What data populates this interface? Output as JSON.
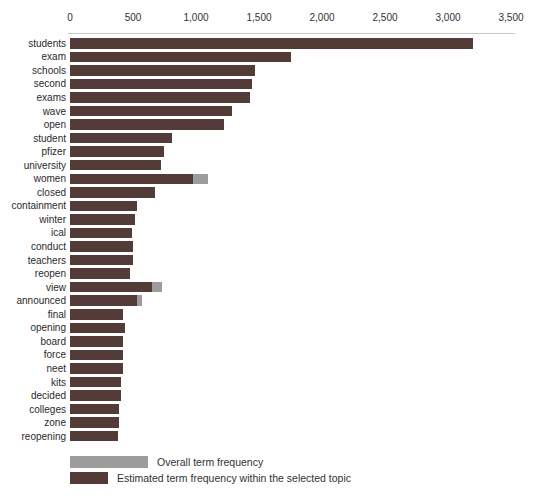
{
  "chart_data": {
    "type": "bar",
    "orientation": "horizontal",
    "title": "",
    "xlabel": "",
    "ylabel": "",
    "axis_position": "top",
    "xlim": [
      0,
      3500
    ],
    "grid": false,
    "x_ticks": {
      "labels": [
        "0",
        "500",
        "1,000",
        "1,500",
        "2,000",
        "2,500",
        "3,000",
        "3,500"
      ],
      "values": [
        0,
        500,
        1000,
        1500,
        2000,
        2500,
        3000,
        3500
      ]
    },
    "categories": [
      "students",
      "exam",
      "schools",
      "second",
      "exams",
      "wave",
      "open",
      "student",
      "pfizer",
      "university",
      "women",
      "closed",
      "containment",
      "winter",
      "ical",
      "conduct",
      "teachers",
      "reopen",
      "view",
      "announced",
      "final",
      "opening",
      "board",
      "force",
      "neet",
      "kits",
      "decided",
      "colleges",
      "zone",
      "reopening"
    ],
    "series": [
      {
        "name": "Overall term frequency",
        "color": "#9c9c9c",
        "values": [
          3200,
          1750,
          1470,
          1445,
          1430,
          1285,
          1225,
          810,
          745,
          720,
          1095,
          675,
          530,
          515,
          490,
          500,
          500,
          475,
          730,
          575,
          420,
          435,
          420,
          420,
          420,
          405,
          405,
          390,
          390,
          380
        ]
      },
      {
        "name": "Estimated term frequency within the selected topic",
        "color": "#533b37",
        "values": [
          3200,
          1750,
          1470,
          1445,
          1430,
          1285,
          1225,
          810,
          745,
          720,
          975,
          675,
          530,
          515,
          490,
          500,
          500,
          475,
          650,
          530,
          420,
          435,
          420,
          420,
          420,
          405,
          405,
          390,
          390,
          380
        ]
      }
    ],
    "legend_position": "bottom"
  }
}
